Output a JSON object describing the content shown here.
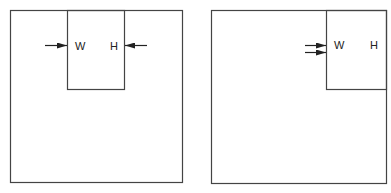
{
  "diagram": {
    "colors": {
      "stroke": "#333333",
      "background": "#ffffff"
    },
    "panels": [
      {
        "id": "left",
        "outer_box": {
          "x": 10,
          "y": 10,
          "w": 172,
          "h": 172
        },
        "inner_rect": {
          "x": 67,
          "y": 10,
          "w": 57,
          "h": 79
        },
        "labels": {
          "w": "W",
          "h": "H"
        },
        "arrows": [
          {
            "direction": "right",
            "pointing_at": "left edge of inner rect",
            "y": 45
          },
          {
            "direction": "left",
            "pointing_at": "right edge of inner rect",
            "y": 45
          }
        ]
      },
      {
        "id": "right",
        "outer_box": {
          "x": 211,
          "y": 10,
          "w": 175,
          "h": 173
        },
        "inner_rect": {
          "x": 326,
          "y": 10,
          "w": 60,
          "h": 79
        },
        "labels": {
          "w": "W",
          "h": "H"
        },
        "arrows": [
          {
            "direction": "right",
            "pointing_at": "left edge of inner rect",
            "y": 44
          },
          {
            "direction": "right",
            "pointing_at": "left edge of inner rect",
            "y": 52
          }
        ]
      }
    ]
  }
}
